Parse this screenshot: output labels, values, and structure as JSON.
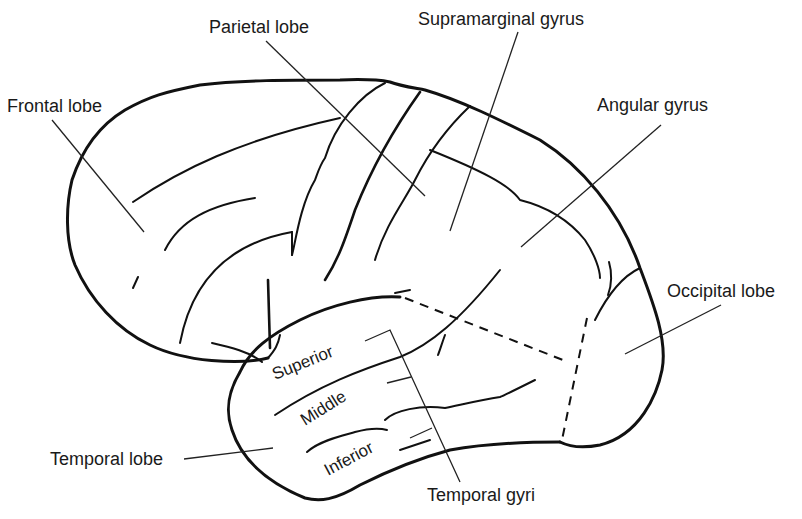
{
  "diagram": {
    "colors": {
      "line": "#111111",
      "text": "#1a1a1a",
      "background": "#ffffff"
    },
    "labels": {
      "frontal_lobe": "Frontal lobe",
      "parietal_lobe": "Parietal lobe",
      "supramarginal_gyrus": "Supramarginal gyrus",
      "angular_gyrus": "Angular gyrus",
      "occipital_lobe": "Occipital lobe",
      "temporal_lobe": "Temporal lobe",
      "temporal_gyri": "Temporal gyri"
    },
    "temporal_gyri_parts": {
      "superior": "Superior",
      "middle": "Middle",
      "inferior": "Inferior"
    }
  }
}
